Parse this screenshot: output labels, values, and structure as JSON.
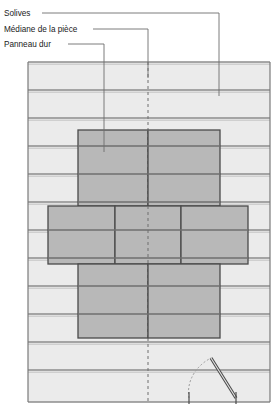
{
  "diagram": {
    "language": "fr",
    "type": "architectural-floor-plan",
    "colors": {
      "background": "#ffffff",
      "joist_fill": "#ebebeb",
      "joist_line": "#8c8c8c",
      "panel_fill": "#b8b8b8",
      "panel_line": "#4a4a4a",
      "leader_line": "#6e6e6e",
      "centerline": "#6e6e6e",
      "door_line": "#4a4a4a",
      "frame_line": "#7a7a7a",
      "text": "#1a1a1a"
    },
    "labels": [
      {
        "id": "solives",
        "text": "Solives",
        "text_x": 4,
        "text_y": 16,
        "leader_x": 219,
        "leader_y_end": 96,
        "dash_x_start": 42,
        "dash_y": 13
      },
      {
        "id": "mediane",
        "text": "Médiane de la pièce",
        "text_x": 4,
        "text_y": 32,
        "leader_x": 148,
        "leader_y_end": 78,
        "dash_x_start": 93,
        "dash_y": 29
      },
      {
        "id": "panneau-dur",
        "text": "Panneau dur",
        "text_x": 4,
        "text_y": 47,
        "leader_x": 104,
        "leader_y_end": 152,
        "dash_x_start": 68,
        "dash_y": 44
      }
    ],
    "frame": {
      "x": 28,
      "y": 62,
      "width": 242,
      "height": 340
    },
    "joist_bands": [
      {
        "y": 62,
        "height": 28
      },
      {
        "y": 90,
        "height": 28
      },
      {
        "y": 118,
        "height": 28
      },
      {
        "y": 146,
        "height": 28
      },
      {
        "y": 174,
        "height": 28
      },
      {
        "y": 202,
        "height": 28
      },
      {
        "y": 230,
        "height": 28
      },
      {
        "y": 258,
        "height": 28
      },
      {
        "y": 286,
        "height": 28
      },
      {
        "y": 314,
        "height": 28
      },
      {
        "y": 342,
        "height": 28
      },
      {
        "y": 370,
        "height": 32
      }
    ],
    "panel_rows": [
      {
        "id": "row-top",
        "y": 130,
        "height": 76,
        "panels": [
          {
            "x": 78,
            "width": 70
          },
          {
            "x": 148,
            "width": 72
          }
        ]
      },
      {
        "id": "row-middle",
        "y": 206,
        "height": 58,
        "panels": [
          {
            "x": 48,
            "width": 67
          },
          {
            "x": 115,
            "width": 66
          },
          {
            "x": 181,
            "width": 67
          }
        ]
      },
      {
        "id": "row-bottom",
        "y": 264,
        "height": 74,
        "panels": [
          {
            "x": 78,
            "width": 70
          },
          {
            "x": 148,
            "width": 72
          }
        ]
      }
    ],
    "centerline": {
      "x": 148,
      "y_top": 62,
      "y_bottom": 402,
      "dash": "3 3"
    },
    "door": {
      "hinge_x": 211,
      "hinge_y": 358,
      "leaf_end_x": 236,
      "leaf_end_y": 398,
      "arc_end_x": 189,
      "arc_end_y": 398,
      "jamb_left_x": 189,
      "jamb_right_x": 236,
      "jamb_y_top": 392,
      "jamb_y_bottom": 404
    }
  }
}
